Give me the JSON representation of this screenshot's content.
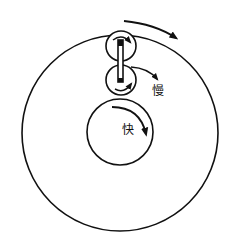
{
  "diagram": {
    "type": "gear-train",
    "labels": {
      "slow": "慢",
      "fast": "快"
    },
    "colors": {
      "stroke": "#111111",
      "background": "#ffffff"
    },
    "components": [
      {
        "name": "outer-ring",
        "cx": 120,
        "cy": 133,
        "r": 98
      },
      {
        "name": "upper-roller",
        "cx": 121,
        "cy": 46,
        "r": 15
      },
      {
        "name": "lower-roller",
        "cx": 121,
        "cy": 80,
        "r": 15
      },
      {
        "name": "inner-wheel",
        "cx": 120,
        "cy": 132,
        "r": 33
      }
    ],
    "arrows": [
      {
        "name": "outer-ring-rotation-arrow",
        "direction": "clockwise"
      },
      {
        "name": "upper-roller-rotation-arrow",
        "direction": "clockwise"
      },
      {
        "name": "lower-roller-rotation-arrow",
        "direction": "counterclockwise"
      },
      {
        "name": "slow-output-arrow",
        "direction": "clockwise",
        "label": "慢"
      },
      {
        "name": "inner-wheel-rotation-arrow",
        "direction": "clockwise",
        "label": "快"
      }
    ]
  }
}
